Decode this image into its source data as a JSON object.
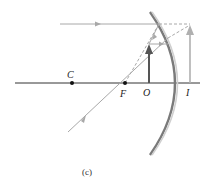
{
  "diagram": {
    "caption": "(c)",
    "labels": {
      "center": "C",
      "focal_point": "F",
      "object": "O",
      "image": "I"
    },
    "elements": [
      "optical-axis",
      "convex-mirror",
      "object-arrow",
      "virtual-image-arrow",
      "incident-parallel-ray",
      "ray-toward-focal-point",
      "reflected-rays",
      "dashed-extension-lines"
    ],
    "colors": {
      "axis": "#333333",
      "object_arrow": "#555555",
      "image_arrow": "#b0b0b0",
      "rays": "#a8a8a8",
      "mirror": "#8a8a8a",
      "points": "#111111"
    }
  }
}
